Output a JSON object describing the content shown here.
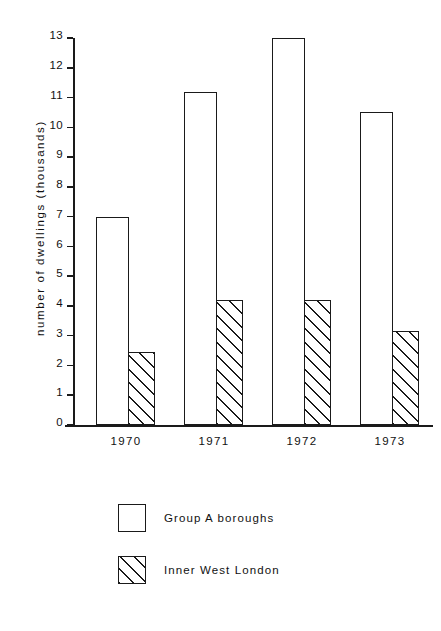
{
  "chart_data": {
    "type": "bar",
    "title": "",
    "xlabel": "",
    "ylabel": "number of dwellings (thousands)",
    "categories": [
      "1970",
      "1971",
      "1972",
      "1973"
    ],
    "series": [
      {
        "name": "Group A  boroughs",
        "fill": "white",
        "values": [
          7.0,
          11.2,
          13.0,
          10.5
        ]
      },
      {
        "name": "Inner West London",
        "fill": "diagonal-hatch",
        "values": [
          2.45,
          4.2,
          4.2,
          3.15
        ]
      }
    ],
    "ylim": [
      0,
      13
    ],
    "yticks": [
      "0",
      "1",
      "2",
      "3",
      "4",
      "5",
      "6",
      "7",
      "8",
      "9",
      "10",
      "11",
      "12",
      "13"
    ],
    "grid": false,
    "legend_position": "bottom-center",
    "axis_color": "#1a1a1a",
    "background_color": "#ffffff"
  },
  "legend": {
    "items": [
      {
        "label": "Group A  boroughs",
        "swatch": "empty-square"
      },
      {
        "label": "Inner West London",
        "swatch": "hatched-square"
      }
    ]
  }
}
